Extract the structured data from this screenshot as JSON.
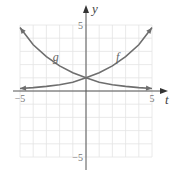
{
  "chart_data": {
    "type": "line",
    "title": "",
    "xlabel": "t",
    "ylabel": "y",
    "xlim": [
      -5,
      5
    ],
    "ylim": [
      -5,
      5
    ],
    "grid": true,
    "x_ticks": [
      {
        "value": -5,
        "label": "−5"
      },
      {
        "value": 5,
        "label": "5"
      }
    ],
    "y_ticks": [
      {
        "value": 5,
        "label": "5"
      },
      {
        "value": -5,
        "label": "−5"
      }
    ],
    "series": [
      {
        "name": "f",
        "label": "f",
        "description": "increasing exponential",
        "x": [
          -5,
          -4,
          -3,
          -2,
          -1,
          0,
          1,
          2,
          3,
          4,
          5
        ],
        "values": [
          0.19,
          0.26,
          0.35,
          0.48,
          0.66,
          1.0,
          1.38,
          1.9,
          2.6,
          3.5,
          4.8
        ],
        "label_at": {
          "x": 2.4,
          "y": 2.3
        }
      },
      {
        "name": "g",
        "label": "g",
        "description": "decreasing exponential",
        "x": [
          -5,
          -4,
          -3,
          -2,
          -1,
          0,
          1,
          2,
          3,
          4,
          5
        ],
        "values": [
          4.8,
          3.5,
          2.6,
          1.9,
          1.38,
          1.0,
          0.66,
          0.48,
          0.35,
          0.26,
          0.19
        ],
        "label_at": {
          "x": -2.3,
          "y": 2.3
        }
      }
    ],
    "color": "#6e6e6e"
  }
}
